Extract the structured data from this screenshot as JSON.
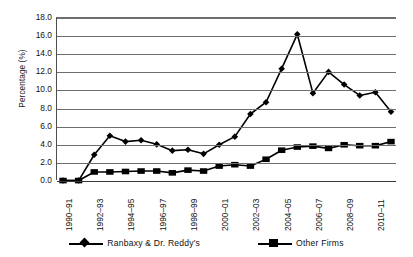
{
  "chart_data": {
    "type": "line",
    "title": "",
    "subtitle": "",
    "xlabel": "",
    "ylabel": "Percentage (%)",
    "ylim": [
      0.0,
      18.0
    ],
    "y_ticks": [
      "0.0",
      "2.0",
      "4.0",
      "6.0",
      "8.0",
      "10.0",
      "12.0",
      "14.0",
      "16.0",
      "18.0"
    ],
    "y_tick_values": [
      0,
      2,
      4,
      6,
      8,
      10,
      12,
      14,
      16,
      18
    ],
    "grid": true,
    "legend_position": "bottom",
    "categories": [
      "1990-91",
      "1991-92",
      "1992-93",
      "1993-94",
      "1994-95",
      "1995-96",
      "1996-97",
      "1997-98",
      "1998-99",
      "1999-00",
      "2000-01",
      "2001-02",
      "2002-03",
      "2003-04",
      "2004-05",
      "2005-06",
      "2006-07",
      "2007-08",
      "2008-09",
      "2009-10",
      "2010-11",
      "2011-12"
    ],
    "visible_x_tick_labels": [
      "1990-91",
      "1992-93",
      "1994-95",
      "1996-97",
      "1998-99",
      "2000-01",
      "2002-03",
      "2004-05",
      "2006-07",
      "2008-09",
      "2010-11"
    ],
    "series": [
      {
        "name": "Ranbaxy & Dr. Reddy's",
        "marker": "diamond",
        "color": "#000000",
        "values": [
          0.05,
          0.05,
          2.9,
          5.0,
          4.35,
          4.5,
          4.05,
          3.35,
          3.45,
          3.0,
          4.0,
          4.9,
          7.4,
          8.7,
          12.4,
          16.2,
          9.7,
          12.05,
          10.65,
          9.45,
          9.8,
          7.65
        ]
      },
      {
        "name": "Other Firms",
        "marker": "square",
        "color": "#000000",
        "values": [
          0.05,
          0.05,
          1.0,
          1.0,
          1.05,
          1.1,
          1.1,
          0.9,
          1.2,
          1.1,
          1.65,
          1.8,
          1.65,
          2.4,
          3.4,
          3.75,
          3.85,
          3.6,
          4.0,
          3.9,
          3.9,
          4.35
        ]
      }
    ]
  },
  "legend": {
    "items": [
      {
        "label": "Ranbaxy & Dr. Reddy's",
        "marker": "diamond"
      },
      {
        "label": "Other Firms",
        "marker": "square"
      }
    ]
  },
  "axis": {
    "y_title": "Percentage (%)"
  }
}
